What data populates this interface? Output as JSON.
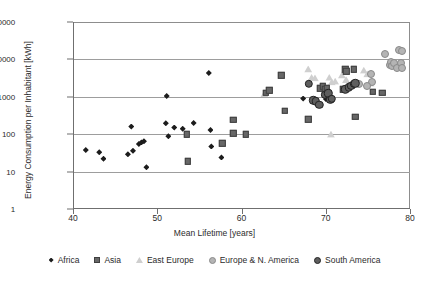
{
  "chart_data": {
    "type": "scatter",
    "title": "",
    "xlabel": "Mean Lifetime [years]",
    "ylabel": "Energy Consumption per Inhabitant [kWh]",
    "xlim": [
      40,
      80
    ],
    "ylim": [
      1,
      100000
    ],
    "yscale": "log",
    "xticks": [
      "40",
      "50",
      "60",
      "70",
      "80"
    ],
    "yticks": [
      "1",
      "10",
      "100",
      "1000",
      "10000",
      "100000"
    ],
    "grid": "horizontal",
    "legend_position": "bottom",
    "series": [
      {
        "name": "Africa",
        "marker": "diamond",
        "color": "#1c1c1c",
        "points": [
          [
            41.4,
            38
          ],
          [
            43.0,
            33
          ],
          [
            43.5,
            22
          ],
          [
            46.4,
            29
          ],
          [
            46.8,
            160
          ],
          [
            47.0,
            36
          ],
          [
            47.7,
            55
          ],
          [
            48.0,
            60
          ],
          [
            48.3,
            65
          ],
          [
            48.6,
            13
          ],
          [
            51.0,
            1050
          ],
          [
            51.2,
            88
          ],
          [
            51.9,
            150
          ],
          [
            52.9,
            140
          ],
          [
            54.2,
            200
          ],
          [
            50.9,
            195
          ],
          [
            56.0,
            4300
          ],
          [
            56.2,
            130
          ],
          [
            56.3,
            47
          ],
          [
            57.5,
            24
          ],
          [
            67.2,
            900
          ],
          [
            69.9,
            870
          ]
        ]
      },
      {
        "name": "Asia",
        "marker": "square",
        "color": "#676767",
        "points": [
          [
            53.4,
            100
          ],
          [
            53.5,
            19
          ],
          [
            58.9,
            240
          ],
          [
            58.9,
            105
          ],
          [
            57.6,
            57
          ],
          [
            60.4,
            100
          ],
          [
            62.8,
            1300
          ],
          [
            63.2,
            1500
          ],
          [
            64.6,
            3800
          ],
          [
            65.0,
            430
          ],
          [
            67.8,
            250
          ],
          [
            69.2,
            1700
          ],
          [
            69.5,
            1900
          ],
          [
            69.8,
            1600
          ],
          [
            70.0,
            1700
          ],
          [
            70.1,
            1250
          ],
          [
            71.9,
            1600
          ],
          [
            72.2,
            5500
          ],
          [
            72.3,
            4800
          ],
          [
            73.2,
            5400
          ],
          [
            73.4,
            290
          ],
          [
            75.5,
            1350
          ],
          [
            76.6,
            1300
          ]
        ]
      },
      {
        "name": "East Europe",
        "marker": "triangle",
        "color": "#cfcfcf",
        "points": [
          [
            62.6,
            1200
          ],
          [
            67.8,
            5500
          ],
          [
            68.2,
            3300
          ],
          [
            68.6,
            3200
          ],
          [
            70.3,
            3300
          ],
          [
            70.6,
            2500
          ],
          [
            71.0,
            2600
          ],
          [
            71.8,
            3800
          ],
          [
            72.3,
            2900
          ],
          [
            70.5,
            100
          ],
          [
            74.4,
            5100
          ],
          [
            74.8,
            4100
          ],
          [
            75.2,
            2300
          ]
        ]
      },
      {
        "name": "Europe & N. America",
        "marker": "circle-light",
        "color": "#b4b4b4",
        "points": [
          [
            75.2,
            4000
          ],
          [
            75.4,
            2500
          ],
          [
            76.9,
            14000
          ],
          [
            77.5,
            7000
          ],
          [
            77.6,
            8500
          ],
          [
            77.7,
            6500
          ],
          [
            78.0,
            8000
          ],
          [
            78.3,
            6000
          ],
          [
            78.6,
            18000
          ],
          [
            78.9,
            17000
          ],
          [
            78.8,
            8000
          ],
          [
            78.9,
            6000
          ],
          [
            74.8,
            1900
          ],
          [
            73.8,
            2200
          ]
        ]
      },
      {
        "name": "South America",
        "marker": "circle-dark",
        "color": "#5e5e5e",
        "points": [
          [
            67.9,
            2200
          ],
          [
            68.4,
            800
          ],
          [
            68.7,
            760
          ],
          [
            69.1,
            600
          ],
          [
            69.8,
            1150
          ],
          [
            70.2,
            1250
          ],
          [
            70.4,
            830
          ],
          [
            70.6,
            880
          ],
          [
            72.2,
            1600
          ],
          [
            72.6,
            1800
          ],
          [
            72.9,
            2000
          ],
          [
            73.2,
            2200
          ],
          [
            73.4,
            2300
          ]
        ]
      }
    ]
  }
}
